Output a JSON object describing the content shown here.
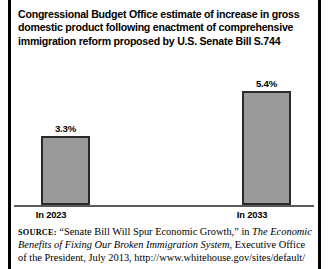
{
  "title": {
    "line1": "Congressional Budget Office estimate of increase in gross",
    "line2": "domestic product following enactment of comprehensive",
    "line3": "immigration reform proposed by U.S. Senate Bill S.744"
  },
  "chart_data": {
    "type": "bar",
    "title": "Congressional Budget Office estimate of increase in gross domestic product following enactment of comprehensive immigration reform proposed by U.S. Senate Bill S.744",
    "categories": [
      "In 2023",
      "In 2033"
    ],
    "values": [
      3.3,
      5.4
    ],
    "data_labels": [
      "3.3%",
      "5.4%"
    ],
    "unit": "percent",
    "xlabel": "",
    "ylabel": "",
    "ylim": [
      0,
      6.8
    ],
    "grid": false,
    "legend": false,
    "bar_color": "#9a9a9a",
    "bar_border_color": "#2b2b2b",
    "axis_color": "#5a5a5a"
  },
  "source": {
    "label": "SOURCE:",
    "line1_a": " “Senate Bill Will Spur Economic Growth,” in ",
    "line1_italic": "The Economic",
    "line2_italic": "Benefits of Fixing Our Broken Immigration System",
    "line2_b": ", Executive Office",
    "line3": "of the President, July 2013, http://www.whitehouse.gov/sites/default/"
  }
}
